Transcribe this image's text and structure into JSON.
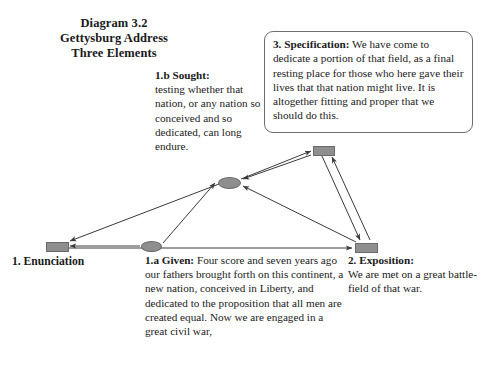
{
  "title": {
    "line1": "Diagram 3.2",
    "line2": "Gettysburg Address",
    "line3": "Three Elements"
  },
  "nodes": {
    "enunciation": {
      "label": "1. Enunciation",
      "shape": "rectangle",
      "color": "#8e8e8e"
    },
    "given": {
      "heading": "1.a Given:",
      "body": " Four score and seven years ago our fathers brought forth on this continent, a new nation, conceived in Liberty, and dedicated to the proposition that all men are created equal. Now we are engaged in a great civil war,",
      "shape": "ellipse",
      "color": "#8e8e8e"
    },
    "sought": {
      "heading": "1.b Sought:",
      "body": "testing whether that nation, or any nation so conceived and so dedicated, can long endure.",
      "shape": "ellipse",
      "color": "#8e8e8e"
    },
    "exposition": {
      "heading": "2. Exposition:",
      "body": "We are met on a great battle-field of that war.",
      "shape": "rectangle",
      "color": "#8e8e8e"
    },
    "specification": {
      "heading": "3. Specification:",
      "body": " We have come to dedicate a portion of that field, as a final resting place for those who here gave their lives that that nation might live.  It is altogether fitting and proper that we should do this.",
      "shape": "rectangle",
      "color": "#8e8e8e"
    }
  },
  "style": {
    "edge_color": "#3a3a3a",
    "node_fill": "#8e8e8e",
    "box_border": "#6d6d6d",
    "background": "#ffffff"
  }
}
